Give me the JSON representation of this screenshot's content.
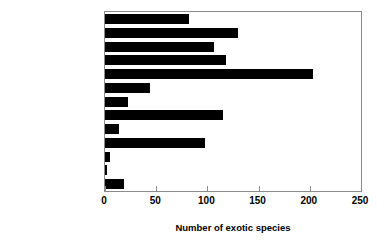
{
  "chart_data": {
    "type": "bar",
    "orientation": "horizontal",
    "title": "",
    "subtitle": "",
    "xlabel": "Number of exotic species",
    "ylabel": "",
    "xlim": [
      0,
      250
    ],
    "xticks": [
      0,
      50,
      100,
      150,
      200,
      250
    ],
    "xtick_labels": [
      "0",
      "50",
      "100",
      "150",
      "200",
      "250"
    ],
    "grid": false,
    "legend": null,
    "bar_color": "#000000",
    "frame_color": "#8a8a8a",
    "categories": [
      "Agriculture",
      "Soil",
      "Fire",
      "Forestry",
      "Domestic animals",
      "Exotic animals",
      "Flooding",
      "Human activities",
      "Environmental",
      "Development",
      "Undefined",
      "Ballast water",
      "Intentional release"
    ],
    "values": [
      82,
      130,
      106,
      118,
      203,
      44,
      22,
      115,
      14,
      98,
      5,
      2,
      19
    ]
  }
}
